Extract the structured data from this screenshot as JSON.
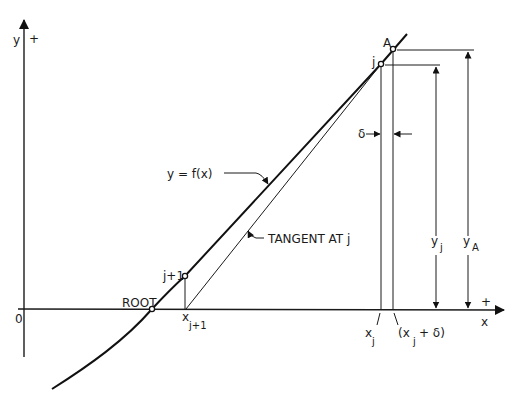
{
  "diagram": {
    "colors": {
      "ink": "#1a1a1a",
      "background": "#ffffff"
    },
    "axes": {
      "y_label": "y",
      "y_sign": "+",
      "x_label": "x",
      "x_sign": "+",
      "origin": "0"
    },
    "curve_label": "y = f(x)",
    "tangent_label": "TANGENT AT j",
    "points": {
      "root": "ROOT",
      "j_plus_1": "j+1",
      "j": "j",
      "a": "A"
    },
    "x_labels": {
      "x_j_plus_1_base": "x",
      "x_j_plus_1_sub": "j+1",
      "x_j_base": "x",
      "x_j_sub": "j",
      "x_j_delta_open": "(x",
      "x_j_delta_sub": "j",
      "x_j_delta_close": " + δ)"
    },
    "dimensions": {
      "delta": "δ",
      "y_j_base": "y",
      "y_j_sub": "j",
      "y_a_base": "y",
      "y_a_sub": "A"
    }
  }
}
